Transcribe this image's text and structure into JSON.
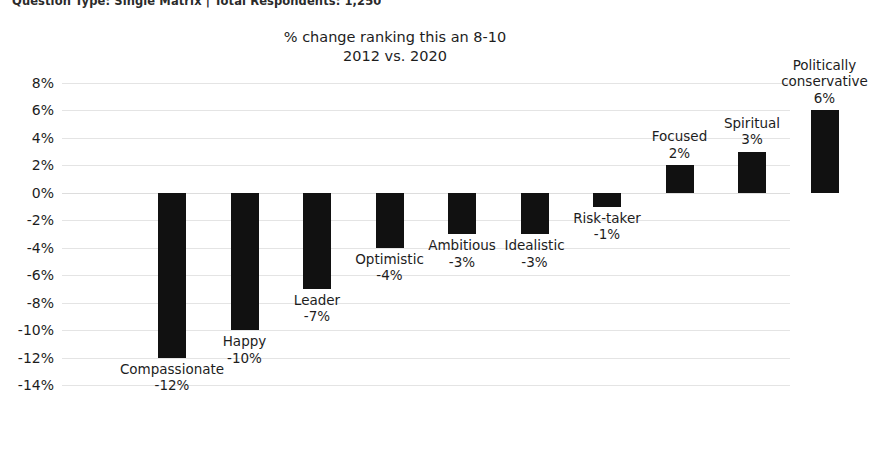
{
  "meta": {
    "line": "Question Type: Single Matrix  |  Total Respondents: 1,250"
  },
  "chart_data": {
    "type": "bar",
    "title": "% change ranking this an 8-10",
    "subtitle": "2012 vs. 2020",
    "xlabel": "",
    "ylabel": "",
    "ylim": [
      -14,
      8
    ],
    "ystep": 2,
    "grid": true,
    "legend": "none",
    "bar_color": "#111111",
    "gridline_color": "#e4e4e4",
    "categories": [
      "Compassionate",
      "Happy",
      "Leader",
      "Optimistic",
      "Ambitious",
      "Idealistic",
      "Risk-taker",
      "Focused",
      "Spiritual",
      "Politically conservative"
    ],
    "values": [
      -12,
      -10,
      -7,
      -4,
      -3,
      -3,
      -1,
      2,
      3,
      6
    ],
    "value_labels": [
      "-12%",
      "-10%",
      "-7%",
      "-4%",
      "-3%",
      "-3%",
      "-1%",
      "2%",
      "3%",
      "6%"
    ],
    "ytick_labels": [
      "8%",
      "6%",
      "4%",
      "2%",
      "0%",
      "-2%",
      "-4%",
      "-6%",
      "-8%",
      "-10%",
      "-12%",
      "-14%"
    ],
    "ytick_values": [
      8,
      6,
      4,
      2,
      0,
      -2,
      -4,
      -6,
      -8,
      -10,
      -12,
      -14
    ]
  }
}
